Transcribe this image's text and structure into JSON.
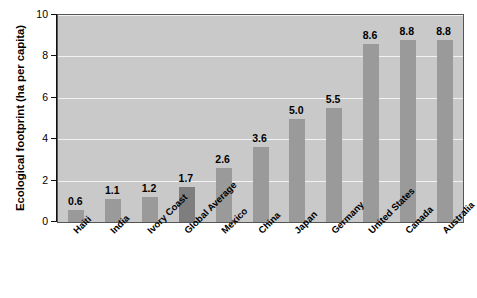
{
  "chart_data": {
    "type": "bar",
    "title": "",
    "xlabel": "",
    "ylabel": "Ecological footprint (ha per capita)",
    "ylim": [
      0,
      10
    ],
    "yticks": [
      0,
      2,
      4,
      6,
      8,
      10
    ],
    "grid": true,
    "legend": "none",
    "categories": [
      "Haiti",
      "India",
      "Ivory Coast",
      "Global Average",
      "Mexico",
      "China",
      "Japan",
      "Germany",
      "United States",
      "Canada",
      "Australia"
    ],
    "values": [
      0.6,
      1.1,
      1.2,
      1.7,
      2.6,
      3.6,
      5.0,
      5.5,
      8.6,
      8.8,
      8.8
    ],
    "value_labels": [
      "0.6",
      "1.1",
      "1.2",
      "1.7",
      "2.6",
      "3.6",
      "5.0",
      "5.5",
      "8.6",
      "8.8",
      "8.8"
    ],
    "highlighted_category": "Global Average",
    "colors": {
      "bar": "#9a9a9a",
      "bar_highlight": "#7e7e7e",
      "plot_background": "#c9c9c9",
      "gridline": "#f2f2f2",
      "axis": "#111111",
      "text": "#000000",
      "page_background": "#ffffff"
    }
  },
  "axis": {
    "y_tick_labels": [
      "0",
      "2",
      "4",
      "6",
      "8",
      "10"
    ]
  }
}
